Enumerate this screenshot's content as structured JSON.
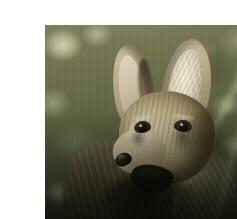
{
  "page": {
    "background_color": "#ffffff",
    "width": 237,
    "height": 219
  },
  "photo": {
    "subject": "fox",
    "caption": "Close-up photograph of a fox with large upright ears",
    "alt_text": "A gray-brown fox with very large pointed ears looks toward the left, photographed close-up against a blurred green and olive foliage background. Its mouth is slightly open showing dark shadow, and its chest and body are in deep shade at the bottom of the frame.",
    "orientation": "landscape",
    "frame": {
      "left": 5,
      "top": 9,
      "width": 224,
      "height": 202
    },
    "palette": {
      "background_olive": "#5d6040",
      "background_highlight": "#d6d6bc",
      "background_dark_green": "#333a22",
      "fur_light": "#ded2b6",
      "fur_mid": "#bdae8c",
      "fur_dark": "#6b5c3c",
      "shadow_black": "#0c0a07",
      "nose_black": "#1a1712",
      "twig_light": "#ded8be"
    },
    "regions": [
      {
        "name": "background-bokeh-left",
        "label": "Blurred olive background with light bokeh highlights"
      },
      {
        "name": "background-foliage-right",
        "label": "Blurred green foliage and leaf streaks"
      },
      {
        "name": "ear-left",
        "label": "Left ear"
      },
      {
        "name": "ear-right",
        "label": "Right ear"
      },
      {
        "name": "head",
        "label": "Head"
      },
      {
        "name": "eye-left",
        "label": "Left eye"
      },
      {
        "name": "eye-right",
        "label": "Right eye"
      },
      {
        "name": "muzzle",
        "label": "Muzzle"
      },
      {
        "name": "nose",
        "label": "Nose"
      },
      {
        "name": "mouth",
        "label": "Open mouth"
      },
      {
        "name": "ruff",
        "label": "Neck ruff"
      },
      {
        "name": "body",
        "label": "Shadowed body and chest"
      },
      {
        "name": "twig",
        "label": "Light twig at right edge"
      }
    ]
  }
}
